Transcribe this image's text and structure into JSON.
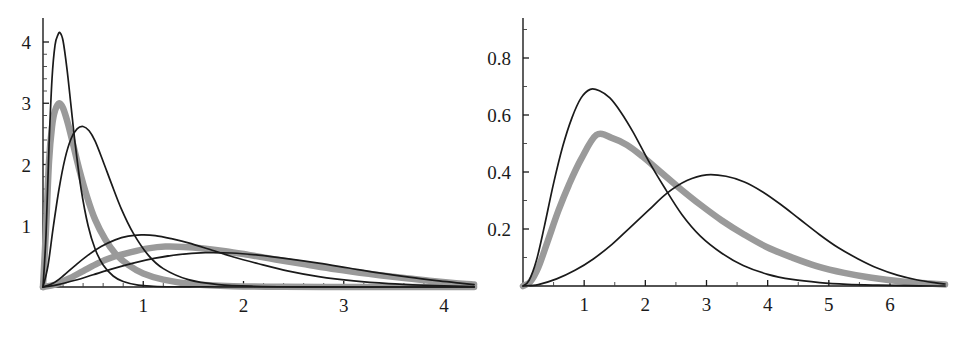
{
  "figure": {
    "name": "two-panel-density-figure",
    "background_color": "#ffffff",
    "curve_black_color": "#1a1a1a",
    "curve_gray_color": "#9a9a9a"
  },
  "chart_data": [
    {
      "type": "line",
      "panel": "left",
      "title": "",
      "subtitle": "",
      "xlabel": "",
      "ylabel": "",
      "xlim": [
        0,
        4.3
      ],
      "ylim": [
        0,
        4.45
      ],
      "grid": false,
      "legend": "none",
      "x_ticks": [
        1,
        2,
        3,
        4
      ],
      "x_tick_labels": [
        "1",
        "2",
        "3",
        "4"
      ],
      "y_ticks": [
        1,
        2,
        3,
        4
      ],
      "y_tick_labels": [
        "1",
        "2",
        "3",
        "4"
      ],
      "x_minor_ticks": [
        0.2,
        0.4,
        0.6,
        0.8,
        1.2,
        1.4,
        1.6,
        1.8,
        2.2,
        2.4,
        2.6,
        2.8,
        3.2,
        3.4,
        3.6,
        3.8
      ],
      "y_minor_ticks": [
        0.2,
        0.4,
        0.6,
        0.8,
        1.2,
        1.4,
        1.6,
        1.8,
        2.2,
        2.4,
        2.6,
        2.8,
        3.2,
        3.4,
        3.6,
        3.8
      ],
      "series": [
        {
          "name": "black-narrow-tall",
          "style": "thin-black",
          "peak_x": 0.17,
          "peak_y": 4.15,
          "x": [
            0.0,
            0.03,
            0.06,
            0.09,
            0.12,
            0.15,
            0.17,
            0.2,
            0.24,
            0.28,
            0.32,
            0.38,
            0.45,
            0.52,
            0.6,
            0.7,
            0.8,
            0.95,
            1.1,
            1.3,
            1.6,
            2.0,
            2.5,
            3.0,
            3.5,
            4.0,
            4.3
          ],
          "y": [
            0.0,
            0.85,
            2.3,
            3.4,
            3.95,
            4.12,
            4.15,
            4.02,
            3.55,
            2.95,
            2.35,
            1.6,
            1.0,
            0.62,
            0.36,
            0.18,
            0.09,
            0.03,
            0.012,
            0.004,
            0.001,
            0.0,
            0.0,
            0.0,
            0.0,
            0.0,
            0.0
          ]
        },
        {
          "name": "gray-narrow",
          "style": "thick-gray",
          "peak_x": 0.16,
          "peak_y": 3.0,
          "x": [
            0.0,
            0.03,
            0.06,
            0.09,
            0.12,
            0.16,
            0.2,
            0.25,
            0.3,
            0.36,
            0.44,
            0.52,
            0.62,
            0.72,
            0.85,
            1.0,
            1.2,
            1.5,
            1.9,
            2.4,
            3.0,
            3.6,
            4.1,
            4.3
          ],
          "y": [
            0.0,
            0.95,
            2.05,
            2.62,
            2.88,
            3.0,
            2.92,
            2.66,
            2.33,
            1.93,
            1.47,
            1.1,
            0.78,
            0.55,
            0.36,
            0.22,
            0.12,
            0.045,
            0.014,
            0.003,
            0.001,
            0.0,
            0.0,
            0.0
          ]
        },
        {
          "name": "black-narrow-second",
          "style": "thin-black",
          "peak_x": 0.4,
          "peak_y": 2.62,
          "x": [
            0.0,
            0.05,
            0.1,
            0.16,
            0.22,
            0.28,
            0.34,
            0.4,
            0.46,
            0.52,
            0.6,
            0.68,
            0.78,
            0.9,
            1.05,
            1.2,
            1.45,
            1.75,
            2.1,
            2.6,
            3.2,
            3.9,
            4.3
          ],
          "y": [
            0.0,
            0.35,
            0.95,
            1.6,
            2.1,
            2.42,
            2.58,
            2.62,
            2.55,
            2.38,
            2.05,
            1.7,
            1.28,
            0.88,
            0.52,
            0.3,
            0.12,
            0.04,
            0.012,
            0.002,
            0.0,
            0.0,
            0.0
          ]
        },
        {
          "name": "black-broad-mid",
          "style": "thin-black",
          "peak_x": 0.98,
          "peak_y": 0.85,
          "x": [
            0.0,
            0.1,
            0.2,
            0.32,
            0.45,
            0.58,
            0.72,
            0.85,
            0.98,
            1.12,
            1.28,
            1.45,
            1.65,
            1.9,
            2.15,
            2.45,
            2.75,
            3.1,
            3.45,
            3.8,
            4.1,
            4.3
          ],
          "y": [
            0.0,
            0.06,
            0.18,
            0.35,
            0.52,
            0.66,
            0.77,
            0.83,
            0.85,
            0.84,
            0.79,
            0.72,
            0.62,
            0.49,
            0.38,
            0.26,
            0.17,
            0.1,
            0.055,
            0.028,
            0.013,
            0.006
          ]
        },
        {
          "name": "gray-broad",
          "style": "thick-gray",
          "peak_x": 1.22,
          "peak_y": 0.66,
          "x": [
            0.0,
            0.12,
            0.25,
            0.4,
            0.55,
            0.7,
            0.88,
            1.05,
            1.22,
            1.4,
            1.6,
            1.82,
            2.05,
            2.32,
            2.6,
            2.92,
            3.25,
            3.58,
            3.88,
            4.12,
            4.3
          ],
          "y": [
            0.0,
            0.04,
            0.13,
            0.26,
            0.39,
            0.49,
            0.57,
            0.63,
            0.66,
            0.655,
            0.63,
            0.585,
            0.525,
            0.45,
            0.375,
            0.29,
            0.215,
            0.15,
            0.1,
            0.062,
            0.04
          ]
        },
        {
          "name": "black-broad-flat",
          "style": "thin-black",
          "peak_x": 1.62,
          "peak_y": 0.56,
          "x": [
            0.0,
            0.15,
            0.32,
            0.5,
            0.7,
            0.9,
            1.12,
            1.35,
            1.62,
            1.88,
            2.15,
            2.45,
            2.75,
            3.05,
            3.35,
            3.65,
            3.95,
            4.18,
            4.3
          ],
          "y": [
            0.0,
            0.04,
            0.11,
            0.2,
            0.3,
            0.39,
            0.47,
            0.53,
            0.56,
            0.555,
            0.52,
            0.46,
            0.39,
            0.31,
            0.23,
            0.16,
            0.1,
            0.06,
            0.04
          ]
        }
      ]
    },
    {
      "type": "line",
      "panel": "right",
      "title": "",
      "subtitle": "",
      "xlabel": "",
      "ylabel": "",
      "xlim": [
        0,
        6.9
      ],
      "ylim": [
        0,
        0.93
      ],
      "grid": false,
      "legend": "none",
      "x_ticks": [
        1,
        2,
        3,
        4,
        5,
        6
      ],
      "x_tick_labels": [
        "1",
        "2",
        "3",
        "4",
        "5",
        "6"
      ],
      "y_ticks": [
        0.2,
        0.4,
        0.6,
        0.8
      ],
      "y_tick_labels": [
        "0.2",
        "0.4",
        "0.6",
        "0.8"
      ],
      "x_minor_ticks": [
        0.5,
        1.5,
        2.5,
        3.5,
        4.5,
        5.5,
        6.5
      ],
      "y_minor_ticks": [
        0.1,
        0.3,
        0.5,
        0.7,
        0.9
      ],
      "series": [
        {
          "name": "black-tall-left",
          "style": "thin-black",
          "peak_x": 1.1,
          "peak_y": 0.69,
          "x": [
            0.0,
            0.1,
            0.22,
            0.35,
            0.5,
            0.65,
            0.8,
            0.95,
            1.1,
            1.25,
            1.42,
            1.6,
            1.8,
            2.05,
            2.3,
            2.6,
            2.9,
            3.25,
            3.6,
            4.0,
            4.4,
            4.85,
            5.3,
            5.8,
            6.3,
            6.8,
            6.9
          ],
          "y": [
            0.0,
            0.02,
            0.09,
            0.21,
            0.36,
            0.49,
            0.59,
            0.66,
            0.69,
            0.685,
            0.66,
            0.61,
            0.54,
            0.44,
            0.35,
            0.25,
            0.175,
            0.115,
            0.072,
            0.041,
            0.023,
            0.012,
            0.006,
            0.003,
            0.001,
            0.0,
            0.0
          ]
        },
        {
          "name": "gray-mid",
          "style": "thick-gray",
          "peak_x": 1.2,
          "peak_y": 0.53,
          "x": [
            0.0,
            0.12,
            0.25,
            0.4,
            0.58,
            0.75,
            0.95,
            1.2,
            1.45,
            1.7,
            1.95,
            2.25,
            2.55,
            2.9,
            3.25,
            3.62,
            4.0,
            4.4,
            4.8,
            5.25,
            5.7,
            6.2,
            6.7,
            6.9
          ],
          "y": [
            0.0,
            0.015,
            0.065,
            0.155,
            0.265,
            0.355,
            0.445,
            0.53,
            0.52,
            0.495,
            0.455,
            0.4,
            0.345,
            0.285,
            0.23,
            0.18,
            0.135,
            0.1,
            0.07,
            0.046,
            0.029,
            0.016,
            0.008,
            0.005
          ]
        },
        {
          "name": "black-broad-right",
          "style": "thin-black",
          "peak_x": 3.0,
          "peak_y": 0.39,
          "x": [
            0.0,
            0.25,
            0.55,
            0.85,
            1.15,
            1.45,
            1.75,
            2.05,
            2.35,
            2.68,
            3.0,
            3.32,
            3.62,
            3.92,
            4.22,
            4.52,
            4.85,
            5.15,
            5.48,
            5.8,
            6.12,
            6.45,
            6.75,
            6.9
          ],
          "y": [
            0.0,
            0.005,
            0.025,
            0.055,
            0.095,
            0.145,
            0.205,
            0.265,
            0.325,
            0.37,
            0.39,
            0.385,
            0.365,
            0.33,
            0.285,
            0.235,
            0.18,
            0.135,
            0.095,
            0.062,
            0.038,
            0.021,
            0.011,
            0.007
          ]
        }
      ]
    }
  ]
}
